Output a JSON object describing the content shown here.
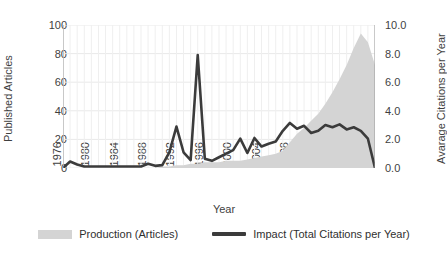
{
  "chart_data": {
    "type": "area",
    "title": "",
    "xlabel": "Year",
    "ylabel": "Published Articles",
    "y2label": "Avarage Citations per Year",
    "grid": true,
    "legend_position": "bottom",
    "xlim": [
      1976,
      2020
    ],
    "ylim": [
      0,
      100
    ],
    "y2lim": [
      0,
      10
    ],
    "xticks": [
      "1976",
      "1980",
      "1984",
      "1988",
      "1992",
      "1996",
      "2000",
      "2004",
      "2008",
      "2012",
      "2016",
      "2020"
    ],
    "yticks_left": [
      "0",
      "20",
      "40",
      "60",
      "80",
      "100"
    ],
    "yticks_right": [
      "0.0",
      "2.0",
      "4.0",
      "6.0",
      "8.0",
      "10.0"
    ],
    "x": [
      1976,
      1977,
      1978,
      1979,
      1980,
      1981,
      1982,
      1983,
      1984,
      1985,
      1986,
      1987,
      1988,
      1989,
      1990,
      1991,
      1992,
      1993,
      1994,
      1995,
      1996,
      1997,
      1998,
      1999,
      2000,
      2001,
      2002,
      2003,
      2004,
      2005,
      2006,
      2007,
      2008,
      2009,
      2010,
      2011,
      2012,
      2013,
      2014,
      2015,
      2016,
      2017,
      2018,
      2019,
      2020
    ],
    "series": [
      {
        "name": "Production (Articles)",
        "axis": "left",
        "style": "area",
        "color": "#d4d4d4",
        "values": [
          0,
          0,
          0,
          0,
          0,
          0,
          0,
          0,
          0,
          0,
          0,
          0,
          0,
          0,
          1,
          1,
          2,
          2,
          3,
          3,
          4,
          4,
          4,
          5,
          5,
          5,
          6,
          7,
          8,
          9,
          10,
          12,
          18,
          24,
          28,
          33,
          38,
          45,
          53,
          62,
          72,
          84,
          94,
          88,
          72
        ]
      },
      {
        "name": "Impact (Total Citations per Year)",
        "axis": "right",
        "style": "line",
        "color": "#3b3b3b",
        "values": [
          0.0,
          0.45,
          0.25,
          0.1,
          0.1,
          0.1,
          0.1,
          0.1,
          0.1,
          0.1,
          0.1,
          0.1,
          0.3,
          0.15,
          0.2,
          1.1,
          2.9,
          1.1,
          0.55,
          7.9,
          0.65,
          0.5,
          0.75,
          1.0,
          1.25,
          2.05,
          1.05,
          2.1,
          1.5,
          1.7,
          1.85,
          2.6,
          3.15,
          2.75,
          2.95,
          2.45,
          2.6,
          3.0,
          2.85,
          3.05,
          2.7,
          2.85,
          2.6,
          2.05,
          0.0
        ]
      }
    ]
  },
  "legend": {
    "items": [
      {
        "label": "Production (Articles)",
        "marker": "area-swatch"
      },
      {
        "label": "Impact (Total Citations per Year)",
        "marker": "line-swatch"
      }
    ]
  }
}
